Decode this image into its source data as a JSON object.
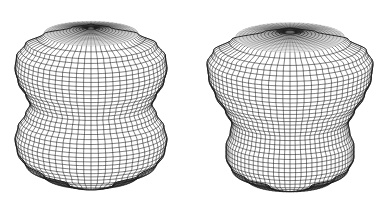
{
  "figure": {
    "background": "#ffffff",
    "line_color": "#1a1a1a",
    "shapes": [
      {
        "id": "left-surface",
        "label": "",
        "cx": 91,
        "top_y": 24,
        "tilt": 0.26,
        "profile": [
          {
            "y": 0.0,
            "r": 0.0
          },
          {
            "y": 0.02,
            "r": 0.25
          },
          {
            "y": 0.06,
            "r": 0.62
          },
          {
            "y": 0.12,
            "r": 0.86
          },
          {
            "y": 0.2,
            "r": 0.98
          },
          {
            "y": 0.28,
            "r": 1.0
          },
          {
            "y": 0.36,
            "r": 0.96
          },
          {
            "y": 0.44,
            "r": 0.86
          },
          {
            "y": 0.5,
            "r": 0.8
          },
          {
            "y": 0.56,
            "r": 0.86
          },
          {
            "y": 0.64,
            "r": 0.96
          },
          {
            "y": 0.72,
            "r": 1.0
          },
          {
            "y": 0.8,
            "r": 0.97
          },
          {
            "y": 0.88,
            "r": 0.86
          },
          {
            "y": 0.95,
            "r": 0.62
          },
          {
            "y": 1.0,
            "r": 0.3
          }
        ],
        "max_r": 76,
        "height": 160,
        "rings": 36,
        "meridians": 64,
        "hole_r": 0.22
      },
      {
        "id": "right-surface",
        "label": "",
        "cx": 290,
        "top_y": 28,
        "tilt": 0.27,
        "profile": [
          {
            "y": 0.0,
            "r": 0.0
          },
          {
            "y": 0.02,
            "r": 0.3
          },
          {
            "y": 0.07,
            "r": 0.7
          },
          {
            "y": 0.14,
            "r": 0.92
          },
          {
            "y": 0.22,
            "r": 1.0
          },
          {
            "y": 0.32,
            "r": 0.98
          },
          {
            "y": 0.42,
            "r": 0.9
          },
          {
            "y": 0.52,
            "r": 0.78
          },
          {
            "y": 0.6,
            "r": 0.7
          },
          {
            "y": 0.66,
            "r": 0.72
          },
          {
            "y": 0.74,
            "r": 0.77
          },
          {
            "y": 0.82,
            "r": 0.77
          },
          {
            "y": 0.9,
            "r": 0.7
          },
          {
            "y": 0.96,
            "r": 0.52
          },
          {
            "y": 1.0,
            "r": 0.25
          }
        ],
        "max_r": 83,
        "height": 158,
        "rings": 34,
        "meridians": 72,
        "hole_r": 0.3
      }
    ]
  }
}
